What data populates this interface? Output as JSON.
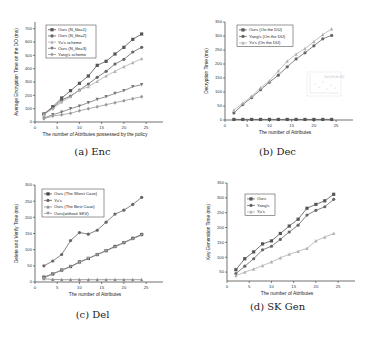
{
  "chart_data": [
    {
      "id": "a",
      "type": "line",
      "caption": "(a) Enc",
      "title": "",
      "xlabel": "The number of Attributes possessed by the policy",
      "ylabel": "Average Encryption Time on the DO (ms)",
      "xlim": [
        0,
        27
      ],
      "ylim": [
        0,
        750
      ],
      "xticks": [
        0,
        5,
        10,
        15,
        20,
        25
      ],
      "yticks": [
        0,
        100,
        200,
        300,
        400,
        500,
        600,
        700
      ],
      "legend_position": "upper left",
      "x": [
        2,
        4,
        6,
        8,
        10,
        12,
        14,
        16,
        18,
        20,
        22,
        24
      ],
      "series": [
        {
          "name": "Ours (N_file=1)",
          "marker": "square",
          "color": "#555555",
          "values": [
            60,
            115,
            180,
            235,
            290,
            345,
            425,
            455,
            510,
            560,
            620,
            660
          ]
        },
        {
          "name": "Ours  (N_file=2)",
          "marker": "circle",
          "color": "#666666",
          "values": [
            60,
            105,
            165,
            195,
            240,
            285,
            335,
            380,
            435,
            470,
            525,
            560
          ]
        },
        {
          "name": "Yu's scheme",
          "marker": "triangle",
          "color": "#b0b0b0",
          "values": [
            55,
            100,
            150,
            190,
            240,
            265,
            305,
            345,
            380,
            415,
            445,
            475
          ]
        },
        {
          "name": "Ours (N_file=3)",
          "marker": "triangle-down",
          "color": "#777777",
          "values": [
            30,
            55,
            75,
            100,
            120,
            145,
            170,
            190,
            215,
            235,
            265,
            280
          ]
        },
        {
          "name": "Yang's scheme",
          "marker": "diamond",
          "color": "#999999",
          "values": [
            25,
            45,
            55,
            65,
            85,
            100,
            115,
            130,
            145,
            160,
            175,
            190
          ]
        }
      ]
    },
    {
      "id": "b",
      "type": "line",
      "caption": "(b) Dec",
      "title": "",
      "xlabel": "The number of Attributes",
      "ylabel": "Decryption Time (ms)",
      "xlim": [
        0,
        27
      ],
      "ylim": [
        0,
        350
      ],
      "xticks": [
        0,
        5,
        10,
        15,
        20,
        25
      ],
      "yticks": [
        0,
        50,
        100,
        150,
        200,
        250,
        300,
        350
      ],
      "legend_position": "upper left",
      "inset": {
        "label": "Ours (On the DU)",
        "note": "small inset plot, near-constant values"
      },
      "x": [
        2,
        4,
        6,
        8,
        10,
        12,
        14,
        16,
        18,
        20,
        22,
        24
      ],
      "series": [
        {
          "name": "Ours (On the DU)",
          "marker": "square",
          "color": "#555555",
          "values": [
            2,
            2,
            2,
            2,
            2,
            2,
            2,
            2,
            2,
            2,
            2,
            2
          ]
        },
        {
          "name": "Yang's (On the DU)",
          "marker": "circle",
          "color": "#666666",
          "values": [
            25,
            55,
            80,
            108,
            135,
            160,
            190,
            218,
            240,
            265,
            290,
            302
          ]
        },
        {
          "name": "Yu's (On the DU)",
          "marker": "triangle",
          "color": "#b0b0b0",
          "values": [
            35,
            60,
            85,
            115,
            140,
            175,
            210,
            235,
            255,
            280,
            305,
            325
          ]
        }
      ]
    },
    {
      "id": "c",
      "type": "line",
      "caption": "(c) Del",
      "title": "",
      "xlabel": "The number of Attributes",
      "ylabel": "Delete and Verify Time (ms)",
      "xlim": [
        0,
        27
      ],
      "ylim": [
        0,
        300
      ],
      "xticks": [
        0,
        5,
        10,
        15,
        20,
        25
      ],
      "yticks": [
        0,
        50,
        100,
        150,
        200,
        250,
        300
      ],
      "legend_position": "upper left",
      "x": [
        2,
        4,
        6,
        8,
        10,
        12,
        14,
        16,
        18,
        20,
        22,
        24
      ],
      "series": [
        {
          "name": "Ours (The Worst Case)",
          "marker": "square",
          "color": "#444444",
          "values": [
            15,
            25,
            37,
            48,
            62,
            73,
            85,
            97,
            110,
            122,
            135,
            147
          ]
        },
        {
          "name": "Yu's",
          "marker": "circle",
          "color": "#666666",
          "values": [
            50,
            65,
            85,
            128,
            153,
            148,
            160,
            185,
            210,
            222,
            240,
            262
          ]
        },
        {
          "name": "Ours (The Best Case)",
          "marker": "triangle",
          "color": "#888888",
          "values": [
            10,
            8,
            7,
            7,
            7,
            7,
            7,
            7,
            7,
            7,
            7,
            7
          ]
        },
        {
          "name": "Ours(without SKV)",
          "marker": "triangle-down",
          "color": "#999999",
          "values": [
            12,
            25,
            36,
            47,
            60,
            72,
            84,
            96,
            108,
            121,
            133,
            145
          ]
        }
      ]
    },
    {
      "id": "d",
      "type": "line",
      "caption": "(d) SK Gen",
      "title": "",
      "xlabel": "The number of Attributes",
      "ylabel": "Key Generation Time (ms)",
      "xlim": [
        0,
        27
      ],
      "ylim": [
        20,
        350
      ],
      "xticks": [
        0,
        5,
        10,
        15,
        20,
        25
      ],
      "yticks": [
        50,
        100,
        150,
        200,
        250,
        300,
        350
      ],
      "legend_position": "upper left",
      "x": [
        2,
        4,
        6,
        8,
        10,
        12,
        14,
        16,
        18,
        20,
        22,
        24
      ],
      "series": [
        {
          "name": "Ours",
          "marker": "square",
          "color": "#555555",
          "values": [
            58,
            95,
            118,
            145,
            155,
            180,
            205,
            228,
            265,
            278,
            290,
            312
          ]
        },
        {
          "name": "Yang's",
          "marker": "circle",
          "color": "#666666",
          "values": [
            45,
            70,
            95,
            125,
            137,
            160,
            185,
            208,
            242,
            258,
            270,
            295
          ]
        },
        {
          "name": "Yu's",
          "marker": "triangle",
          "color": "#b0b0b0",
          "values": [
            38,
            50,
            60,
            72,
            84,
            98,
            110,
            120,
            130,
            155,
            168,
            180
          ]
        }
      ]
    }
  ]
}
